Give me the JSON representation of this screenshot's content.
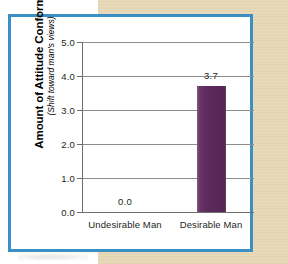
{
  "figure": {
    "frame_color": "#3a8fc4",
    "background_panel_color": "#e7d8b6",
    "plot_background_color": "#ffffff"
  },
  "chart_data": {
    "type": "bar",
    "title": "",
    "subtitle": "",
    "xlabel": "",
    "ylabel": "Amount of Attitude Conformity",
    "ylabel_sub": "(Shift toward man's views)",
    "categories": [
      "Undesirable Man",
      "Desirable Man"
    ],
    "values": [
      0.0,
      3.7
    ],
    "value_labels": [
      "0.0",
      "3.7"
    ],
    "ylim": [
      0.0,
      5.0
    ],
    "ytick_values": [
      0.0,
      1.0,
      2.0,
      3.0,
      4.0,
      5.0
    ],
    "ytick_labels": [
      "0.0",
      "1.0",
      "2.0",
      "3.0",
      "4.0",
      "5.0"
    ],
    "grid": true,
    "grid_axis": "y",
    "legend": false,
    "legend_position": "none",
    "bar_color": "#5e2b5e",
    "grid_color": "#8d8d8d",
    "axis_color": "#6d6d6d",
    "text_color": "#231f20"
  }
}
